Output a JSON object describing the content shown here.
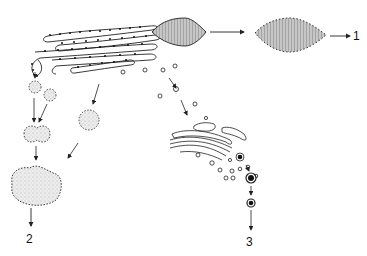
{
  "diagram": {
    "type": "cell-biology-pathway",
    "nodes": [
      {
        "id": "rer",
        "label": "rough endoplasmic reticulum cisternae with ribosomes"
      },
      {
        "id": "granule_start",
        "label": "hatched secretory granule attached to ER"
      },
      {
        "id": "granule_free",
        "label": "free hatched secretory granule"
      },
      {
        "id": "vesicles_left",
        "label": "ribosome-studded vesicles"
      },
      {
        "id": "fused_vesicle",
        "label": "fused vesicle"
      },
      {
        "id": "large_body",
        "label": "large stippled body"
      },
      {
        "id": "golgi",
        "label": "Golgi apparatus stack"
      },
      {
        "id": "dense_granule_1",
        "label": "dense-core granule"
      },
      {
        "id": "dense_granule_2",
        "label": "dense-core granule"
      }
    ],
    "pathway_labels": {
      "p1": "1",
      "p2": "2",
      "p3": "3"
    },
    "colors": {
      "line": "#222222",
      "hatch_fill": "#b8b8b8",
      "stipple_fill": "#e6e6e6",
      "background": "#ffffff"
    }
  }
}
